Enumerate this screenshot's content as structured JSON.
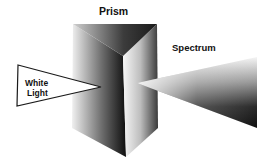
{
  "diagram": {
    "labels": {
      "prism": "Prism",
      "spectrum": "Spectrum",
      "white_light_line1": "White",
      "white_light_line2": "Light"
    },
    "colors": {
      "background": "#ffffff",
      "ink": "#111111",
      "shade_dark": "#1a1a1a",
      "shade_light": "#f2f2f2"
    }
  }
}
